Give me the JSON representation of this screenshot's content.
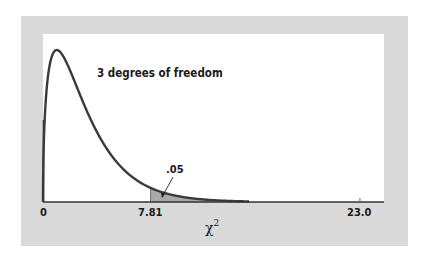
{
  "chart_data": {
    "type": "line",
    "title": "",
    "distribution": "chi-square",
    "degrees_of_freedom": 3,
    "annotation": "3 degrees of freedom",
    "shaded_region": {
      "from": 7.81,
      "label": ".05",
      "fill": "#a9a9a9"
    },
    "xlabel": "χ²",
    "ylabel": "",
    "x_ticks": [
      {
        "value": 0,
        "label": "0"
      },
      {
        "value": 7.81,
        "label": "7.81"
      },
      {
        "value": 23.0,
        "label": "23.0"
      }
    ],
    "xlim": [
      0,
      24.8
    ],
    "grid": false,
    "legend": "none",
    "series": [
      {
        "name": "chi-square density (df=3)",
        "x": [
          0,
          0.5,
          1,
          2,
          3,
          4,
          5,
          6,
          7,
          7.81,
          9,
          10,
          12,
          15
        ],
        "values": [
          0,
          0.2197,
          0.242,
          0.2076,
          0.1542,
          0.108,
          0.0732,
          0.0487,
          0.0319,
          0.0197,
          0.0133,
          0.0085,
          0.0033,
          0.0007
        ]
      }
    ]
  },
  "labels": {
    "annotation": "3 degrees of freedom",
    "tail_prob": ".05",
    "tick_0": "0",
    "tick_781": "7.81",
    "tick_23": "23.0",
    "xlabel_base": "χ",
    "xlabel_sup": "2"
  },
  "colors": {
    "panel": "#d9d9d9",
    "plot_bg": "#ffffff",
    "curve": "#3a3a3a",
    "shade": "#a9a9a9"
  }
}
